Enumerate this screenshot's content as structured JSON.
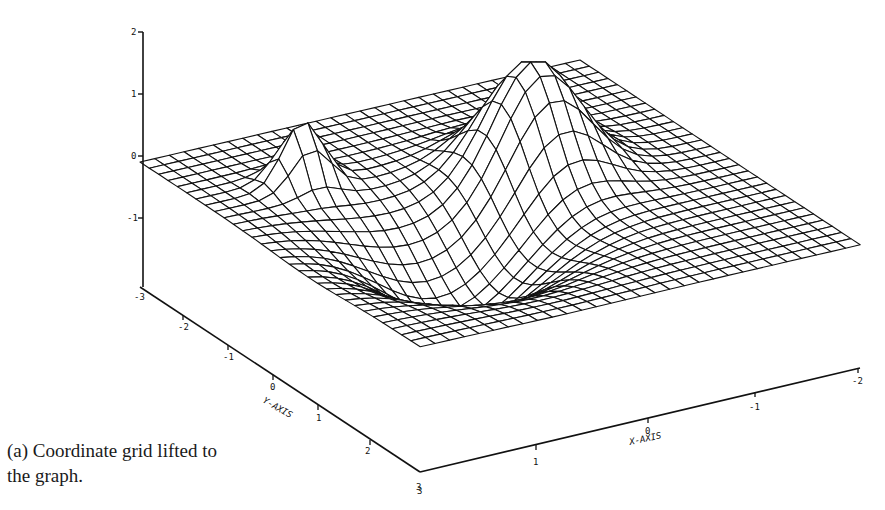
{
  "caption": {
    "label": "(a)",
    "line1": "(a) Coordinate grid lifted to",
    "line2": "the graph."
  },
  "colors": {
    "ink": "#111111",
    "background": "#ffffff"
  },
  "chart_data": {
    "type": "surface",
    "title": "",
    "caption": "(a) Coordinate grid lifted to the graph.",
    "xlabel": "X-AXIS",
    "ylabel": "Y-AXIS",
    "zlabel": "",
    "xlim": [
      3,
      -2
    ],
    "ylim": [
      -3,
      3
    ],
    "zlim": [
      -2,
      2
    ],
    "x_ticks": [
      "3",
      "1",
      "0",
      "-1",
      "-2"
    ],
    "x_tick_values": [
      3,
      1,
      0,
      -1,
      -2
    ],
    "y_ticks": [
      "-3",
      "-2",
      "-1",
      "0",
      "1",
      "2",
      "3"
    ],
    "y_tick_values": [
      -3,
      -2,
      -1,
      0,
      1,
      2,
      3
    ],
    "z_ticks": [
      "2",
      "1",
      "0",
      "-1",
      "-2"
    ],
    "z_tick_values": [
      2,
      1,
      0,
      -1,
      -2
    ],
    "grid": {
      "nx": 30,
      "ny": 30
    },
    "features": [
      {
        "kind": "sharp peak",
        "x": 1.9,
        "y": -1.6,
        "z": 0.75
      },
      {
        "kind": "broad peak",
        "x": -0.2,
        "y": -0.6,
        "z": 1.75
      },
      {
        "kind": "trough",
        "x": 1.3,
        "y": 0.6,
        "z": -1.3
      }
    ],
    "mesh_style": "black wireframe, hidden-line removed",
    "surface_params": {
      "bumps": [
        {
          "x0": 1.9,
          "y0": -1.6,
          "sx": 0.22,
          "sy": 0.22,
          "a": 1.0
        },
        {
          "x0": -0.2,
          "y0": -0.6,
          "sx": 0.45,
          "sy": 0.55,
          "a": 1.8
        },
        {
          "x0": 1.3,
          "y0": 0.6,
          "sx": 0.7,
          "sy": 0.8,
          "a": -1.3
        }
      ]
    }
  }
}
